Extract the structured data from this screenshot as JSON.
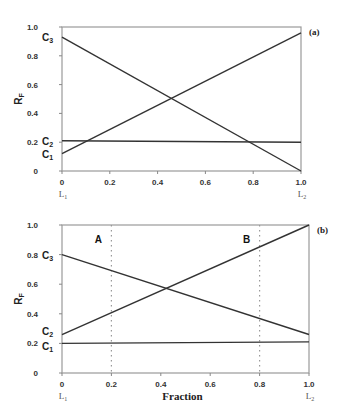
{
  "chart_data": [
    {
      "type": "line",
      "panel_label": "(a)",
      "ylabel": "RF",
      "xlabel": "",
      "x_end_labels": [
        "L1",
        "L2"
      ],
      "xlim": [
        0,
        1.0
      ],
      "ylim": [
        0,
        1.0
      ],
      "xticks": [
        "0",
        "0.2",
        "0.4",
        "0.6",
        "0.8",
        "1.0"
      ],
      "yticks": [
        "0",
        "0.2",
        "0.4",
        "0.6",
        "0.8",
        "1.0"
      ],
      "grid": false,
      "series": [
        {
          "name": "C1",
          "x": [
            0,
            1.0
          ],
          "values": [
            0.12,
            0.96
          ]
        },
        {
          "name": "C2",
          "x": [
            0,
            1.0
          ],
          "values": [
            0.21,
            0.2
          ]
        },
        {
          "name": "C3",
          "x": [
            0,
            1.0
          ],
          "values": [
            0.93,
            0.0
          ]
        }
      ]
    },
    {
      "type": "line",
      "panel_label": "(b)",
      "ylabel": "RF",
      "xlabel": "Fraction",
      "x_end_labels": [
        "L1",
        "L2"
      ],
      "xlim": [
        0,
        1.0
      ],
      "ylim": [
        0,
        1.0
      ],
      "xticks": [
        "0",
        "0.2",
        "0.4",
        "0.6",
        "0.8",
        "1.0"
      ],
      "yticks": [
        "0",
        "0.2",
        "0.4",
        "0.6",
        "0.8",
        "1.0"
      ],
      "grid": false,
      "annotations": [
        {
          "label": "A",
          "x": 0.2,
          "style": "dotted-vertical"
        },
        {
          "label": "B",
          "x": 0.8,
          "style": "dotted-vertical"
        }
      ],
      "series": [
        {
          "name": "C1",
          "x": [
            0,
            1.0
          ],
          "values": [
            0.2,
            0.21
          ]
        },
        {
          "name": "C2",
          "x": [
            0,
            1.0
          ],
          "values": [
            0.26,
            1.0
          ]
        },
        {
          "name": "C3",
          "x": [
            0,
            1.0
          ],
          "values": [
            0.8,
            0.26
          ]
        }
      ]
    }
  ]
}
